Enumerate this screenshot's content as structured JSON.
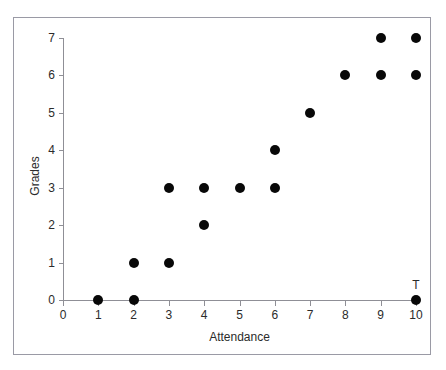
{
  "figure": {
    "top_cut_text": "",
    "frame_color": "#9a9aa5",
    "axis_color": "#8f8f96",
    "marker_color": "#080808",
    "background": "#ffffff"
  },
  "chart_data": {
    "type": "scatter",
    "title": "",
    "xlabel": "Attendance",
    "ylabel": "Grades",
    "xlim": [
      0,
      10
    ],
    "ylim": [
      0,
      7
    ],
    "xticks": [
      0,
      1,
      2,
      3,
      4,
      5,
      6,
      7,
      8,
      9,
      10
    ],
    "xticklabels": [
      "0",
      "1",
      "2",
      "3",
      "4",
      "5",
      "6",
      "7",
      "8",
      "9",
      "10"
    ],
    "yticks": [
      0,
      1,
      2,
      3,
      4,
      5,
      6,
      7
    ],
    "yticklabels": [
      "0",
      "1",
      "2",
      "3",
      "4",
      "5",
      "6",
      "7"
    ],
    "grid": false,
    "legend": null,
    "marker": "filled-circle",
    "marker_size_px": 10,
    "x": [
      1,
      2,
      2,
      3,
      3,
      4,
      4,
      5,
      6,
      6,
      7,
      8,
      9,
      9,
      10,
      10,
      10
    ],
    "y": [
      0,
      0,
      1,
      1,
      3,
      2,
      3,
      3,
      3,
      4,
      5,
      6,
      6,
      7,
      0,
      6,
      7
    ],
    "points": [
      {
        "x": 1,
        "y": 0
      },
      {
        "x": 2,
        "y": 0
      },
      {
        "x": 2,
        "y": 1
      },
      {
        "x": 3,
        "y": 1
      },
      {
        "x": 3,
        "y": 3
      },
      {
        "x": 4,
        "y": 2
      },
      {
        "x": 4,
        "y": 3
      },
      {
        "x": 5,
        "y": 3
      },
      {
        "x": 6,
        "y": 3
      },
      {
        "x": 6,
        "y": 4
      },
      {
        "x": 7,
        "y": 5
      },
      {
        "x": 8,
        "y": 6
      },
      {
        "x": 9,
        "y": 6
      },
      {
        "x": 9,
        "y": 7
      },
      {
        "x": 10,
        "y": 0
      },
      {
        "x": 10,
        "y": 6
      },
      {
        "x": 10,
        "y": 7
      }
    ],
    "annotations": [
      {
        "label": "T",
        "x": 10,
        "y": 0
      }
    ]
  }
}
